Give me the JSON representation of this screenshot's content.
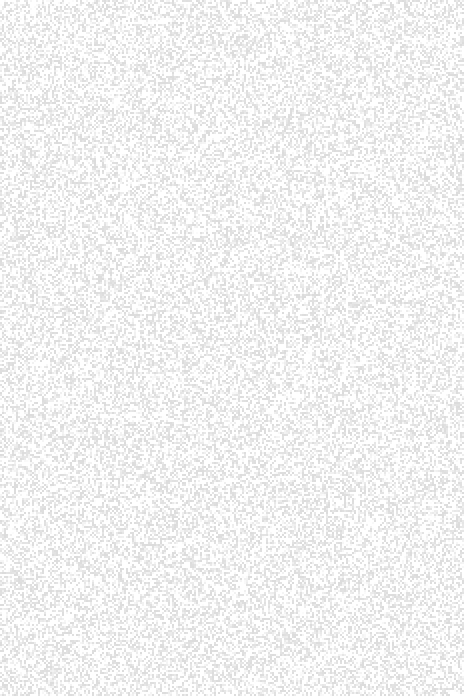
{
  "image": {
    "kind": "noise-texture",
    "description": "Uniform fine-grained stipple / dither noise texture on a white field. No interface elements, text, or graphics are present.",
    "width": 464,
    "height": 696,
    "background_color": "#ffffff"
  },
  "texture": {
    "pattern": "random-grayscale-lattice",
    "cell_size_px": 2,
    "grid_columns": 232,
    "grid_rows": 348,
    "tone_min_hex": "#dcdcdc",
    "tone_max_hex": "#ffffff",
    "tone_min_value": 220,
    "tone_max_value": 255,
    "coverage_fraction": 0.55,
    "uniform": true,
    "has_gradient": false,
    "has_text": false,
    "has_border": false,
    "seed": 20240517
  }
}
